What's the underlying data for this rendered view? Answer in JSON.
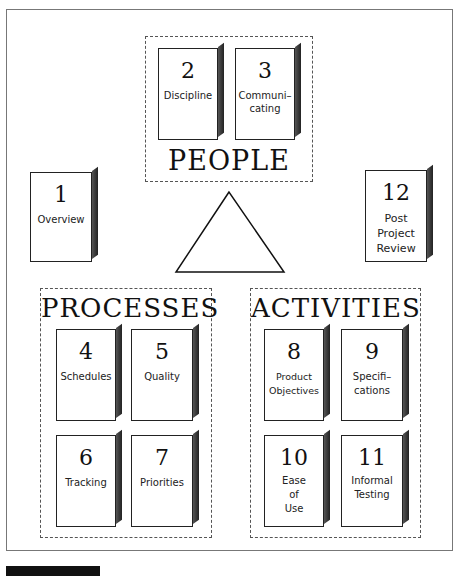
{
  "diagram": {
    "groups": {
      "people": {
        "title": "PEOPLE"
      },
      "processes": {
        "title": "PROCESSES"
      },
      "activities": {
        "title": "ACTIVITIES"
      }
    },
    "cards": {
      "c1": {
        "number": "1",
        "label": "Overview"
      },
      "c2": {
        "number": "2",
        "label": "Discipline"
      },
      "c3": {
        "number": "3",
        "label": "Communi–\ncating"
      },
      "c4": {
        "number": "4",
        "label": "Schedules"
      },
      "c5": {
        "number": "5",
        "label": "Quality"
      },
      "c6": {
        "number": "6",
        "label": "Tracking"
      },
      "c7": {
        "number": "7",
        "label": "Priorities"
      },
      "c8": {
        "number": "8",
        "label": "Product\nObjectives"
      },
      "c9": {
        "number": "9",
        "label": "Specifi–\ncations"
      },
      "c10": {
        "number": "10",
        "label": "Ease\nof\nUse"
      },
      "c11": {
        "number": "11",
        "label": "Informal\nTesting"
      },
      "c12": {
        "number": "12",
        "label": "Post\nProject\nReview"
      }
    },
    "center_shape": "triangle"
  }
}
